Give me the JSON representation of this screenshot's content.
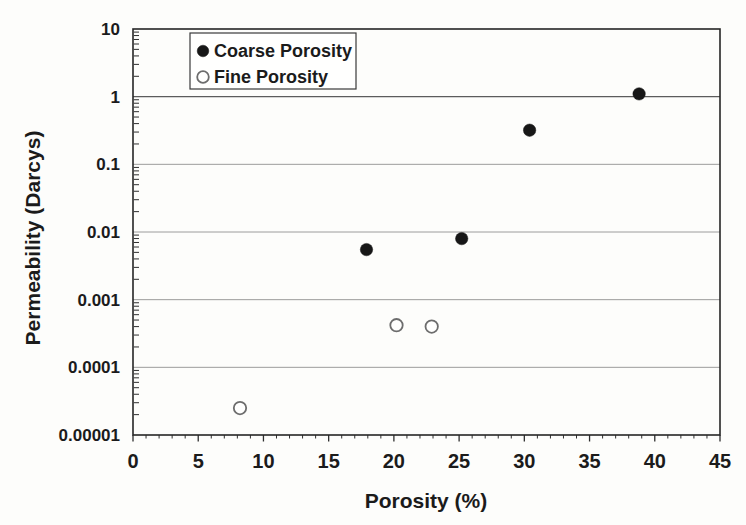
{
  "chart_data": {
    "type": "scatter",
    "title": "",
    "xlabel": "Porosity (%)",
    "ylabel": "Permeability (Darcys)",
    "x_axis": {
      "min": 0,
      "max": 45,
      "major_tick_values": [
        0,
        5,
        10,
        15,
        20,
        25,
        30,
        35,
        40,
        45
      ],
      "tick_labels": [
        "0",
        "5",
        "10",
        "15",
        "20",
        "25",
        "30",
        "35",
        "40",
        "45"
      ],
      "minor_tick_step": 1
    },
    "y_axis": {
      "scale": "log",
      "min": 1e-05,
      "max": 10,
      "tick_values": [
        10,
        1,
        0.1,
        0.01,
        0.001,
        0.0001,
        1e-05
      ],
      "tick_labels": [
        "10",
        "1",
        "0.1",
        "0.01",
        "0.001",
        "0.0001",
        "0.00001"
      ],
      "minor_ticks": "log-decade-2-to-9"
    },
    "grid": {
      "horizontal": true,
      "vertical": false
    },
    "legend": {
      "position": "top-left-inside",
      "entries": [
        {
          "label": "Coarse Porosity",
          "marker": "filled-circle"
        },
        {
          "label": "Fine Porosity",
          "marker": "open-circle"
        }
      ]
    },
    "series": [
      {
        "name": "Coarse Porosity",
        "marker": "filled-circle",
        "marker_color": "#171717",
        "points": [
          {
            "x": 17.9,
            "y": 0.0055
          },
          {
            "x": 25.2,
            "y": 0.008
          },
          {
            "x": 30.4,
            "y": 0.32
          },
          {
            "x": 38.8,
            "y": 1.1
          }
        ]
      },
      {
        "name": "Fine Porosity",
        "marker": "open-circle",
        "marker_color": "#ffffff",
        "marker_stroke": "#6d6d6d",
        "points": [
          {
            "x": 8.2,
            "y": 2.5e-05
          },
          {
            "x": 20.2,
            "y": 0.00042
          },
          {
            "x": 22.9,
            "y": 0.0004
          }
        ]
      }
    ]
  },
  "colors": {
    "background": "#fdfdfb",
    "plot_border": "#262626",
    "gridline": "#919191",
    "gridline_unit": "#5c5c5c",
    "text": "#1b1b1b",
    "coarse_marker": "#171717",
    "fine_marker_stroke": "#6d6d6d"
  }
}
